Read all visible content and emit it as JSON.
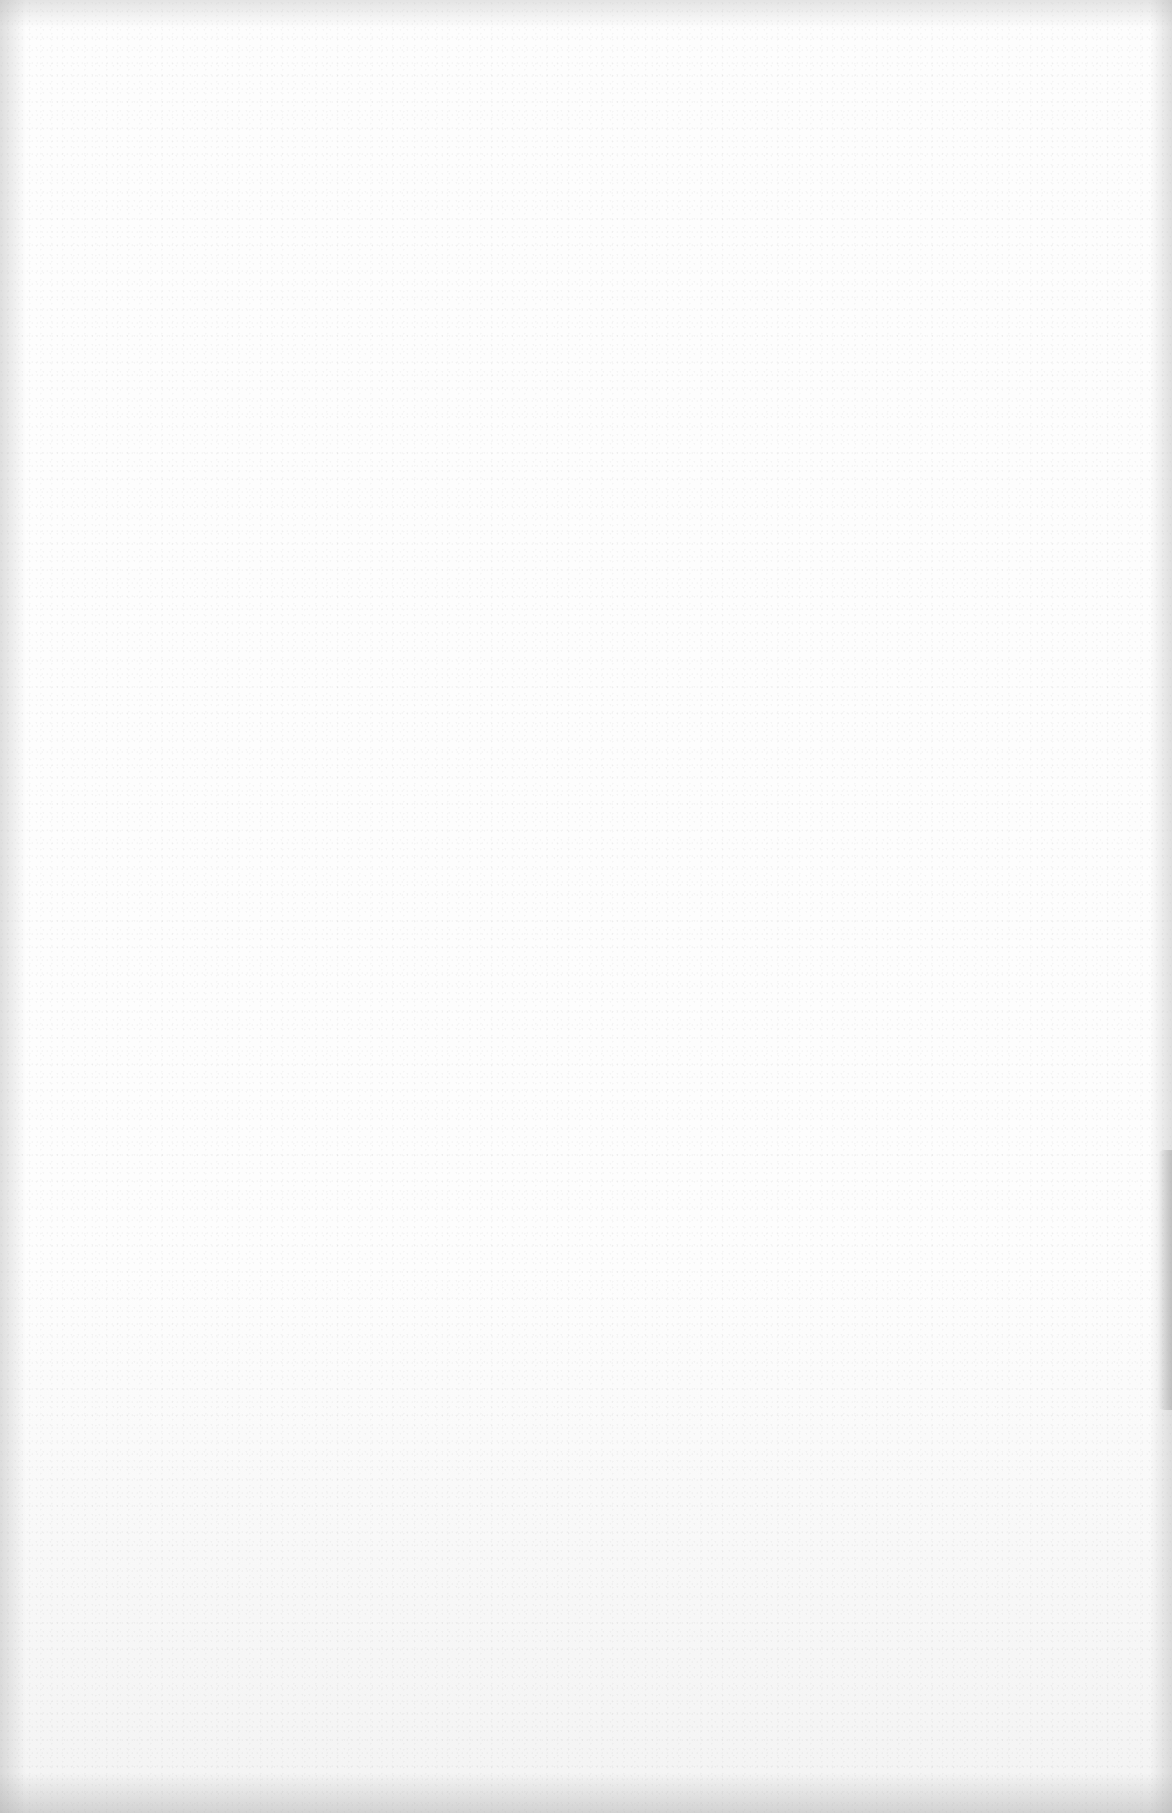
{
  "page": {
    "type": "blank-scanned-sheet",
    "background_color": "#fdfdfd",
    "edge_shadow_color": "#969696",
    "text": ""
  }
}
